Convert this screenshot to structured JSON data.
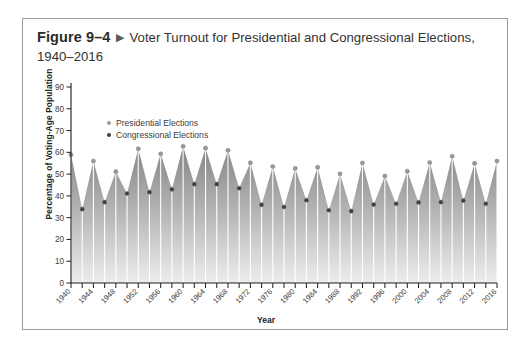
{
  "caption": {
    "figure_number": "Figure 9–4",
    "arrow": "▶",
    "title": "Voter Turnout for Presidential and Congressional Elections, 1940–2016"
  },
  "legend": {
    "position": "inside-top-left",
    "items": [
      {
        "label": "Presidential Elections",
        "color": "#9a9a9a",
        "marker": "dot"
      },
      {
        "label": "Congressional Elections",
        "color": "#3f3f3f",
        "marker": "dot"
      }
    ]
  },
  "colors": {
    "fill_top": "#8e8e8e",
    "fill_bottom": "#e6e6e6",
    "axis": "#1d1d1d",
    "presidential_marker": "#9a9a9a",
    "congressional_marker": "#3f3f3f",
    "dropline": "#ffffff",
    "border": "#9a9a9a",
    "text": "#333333"
  },
  "chart_data": {
    "type": "area",
    "title": "Voter Turnout for Presidential and Congressional Elections, 1940–2016",
    "xlabel": "Year",
    "ylabel": "Percentage of Voting-Age Population",
    "xlim": [
      1940,
      2016
    ],
    "ylim": [
      0,
      90
    ],
    "ytick_step": 10,
    "yticks": [
      0,
      10,
      20,
      30,
      40,
      50,
      60,
      70,
      80,
      90
    ],
    "xtick_labels": [
      "1940",
      "1944",
      "1948",
      "1952",
      "1956",
      "1960",
      "1964",
      "1968",
      "1972",
      "1976",
      "1980",
      "1984",
      "1988",
      "1992",
      "1996",
      "2000",
      "2004",
      "2008",
      "2012",
      "2016"
    ],
    "xtick_minor_step": 2,
    "grid": false,
    "x": [
      1940,
      1942,
      1944,
      1946,
      1948,
      1950,
      1952,
      1954,
      1956,
      1958,
      1960,
      1962,
      1964,
      1966,
      1968,
      1970,
      1972,
      1974,
      1976,
      1978,
      1980,
      1982,
      1984,
      1986,
      1988,
      1990,
      1992,
      1994,
      1996,
      1998,
      2000,
      2002,
      2004,
      2006,
      2008,
      2010,
      2012,
      2014,
      2016
    ],
    "values": [
      58.9,
      33.9,
      56.0,
      37.1,
      51.1,
      41.1,
      61.6,
      41.7,
      59.3,
      43.0,
      62.8,
      45.4,
      61.9,
      45.4,
      60.9,
      43.5,
      55.2,
      35.9,
      53.5,
      34.9,
      52.6,
      38.0,
      53.1,
      33.4,
      50.1,
      33.0,
      55.1,
      36.0,
      49.1,
      36.4,
      51.3,
      37.0,
      55.3,
      37.1,
      58.2,
      37.8,
      54.9,
      36.4,
      56.0
    ],
    "series": [
      {
        "name": "Presidential Elections",
        "color": "#9a9a9a",
        "x": [
          1940,
          1944,
          1948,
          1952,
          1956,
          1960,
          1964,
          1968,
          1972,
          1976,
          1980,
          1984,
          1988,
          1992,
          1996,
          2000,
          2004,
          2008,
          2012,
          2016
        ],
        "values": [
          58.9,
          56.0,
          51.1,
          61.6,
          59.3,
          62.8,
          61.9,
          60.9,
          55.2,
          53.5,
          52.6,
          53.1,
          50.1,
          55.1,
          49.1,
          51.3,
          55.3,
          58.2,
          54.9,
          56.0
        ]
      },
      {
        "name": "Congressional Elections",
        "color": "#3f3f3f",
        "x": [
          1942,
          1946,
          1950,
          1954,
          1958,
          1962,
          1966,
          1970,
          1974,
          1978,
          1982,
          1986,
          1990,
          1994,
          1998,
          2002,
          2006,
          2010,
          2014
        ],
        "values": [
          33.9,
          37.1,
          41.1,
          41.7,
          43.0,
          45.4,
          45.4,
          43.5,
          35.9,
          34.9,
          38.0,
          33.4,
          33.0,
          36.0,
          36.4,
          37.0,
          37.1,
          37.8,
          36.4
        ]
      }
    ]
  }
}
